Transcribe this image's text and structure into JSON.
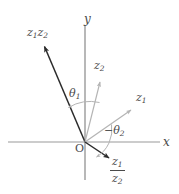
{
  "figure": {
    "background_color": "#ffffff",
    "width": 179,
    "height": 194
  },
  "colors": {
    "axis": "#9a9a9a",
    "vector_dark": "#2b2b2b",
    "vector_light": "#b4b4b4",
    "arc": "#b4b4b4",
    "text": "#4a4a4a"
  },
  "axes": {
    "origin_label": "O",
    "x_label": "x",
    "y_label": "y",
    "x_axis": {
      "x1": 8,
      "y1": 142,
      "x2": 160,
      "y2": 142
    },
    "y_axis": {
      "x1": 85,
      "y1": 25,
      "x2": 85,
      "y2": 180
    }
  },
  "vectors": [
    {
      "name": "z1z2",
      "label_parts": [
        "z",
        "1",
        "z",
        "2"
      ],
      "label_text": "z₁z₂",
      "style": "dark",
      "from": {
        "x": 85,
        "y": 142
      },
      "to": {
        "x": 42,
        "y": 41
      }
    },
    {
      "name": "z2",
      "label_text": "z₂",
      "style": "light",
      "from": {
        "x": 85,
        "y": 142
      },
      "to": {
        "x": 101,
        "y": 78
      }
    },
    {
      "name": "z1",
      "label_text": "z₁",
      "style": "light",
      "from": {
        "x": 85,
        "y": 142
      },
      "to": {
        "x": 134,
        "y": 107
      }
    },
    {
      "name": "z1-over-z2",
      "label_numerator": "z₁",
      "label_denominator": "z₂",
      "style": "dark",
      "from": {
        "x": 85,
        "y": 142
      },
      "to": {
        "x": 113,
        "y": 161
      }
    }
  ],
  "angles": [
    {
      "name": "theta1",
      "label_text": "θ₁",
      "description": "arc from z2 direction rotating counter-clockwise to z1z2 direction"
    },
    {
      "name": "minus-theta2",
      "label_text": "−θ₂",
      "description": "arc from positive x-axis / z1 direction rotating clockwise to z1/z2 direction"
    }
  ],
  "labels": {
    "y": "y",
    "x": "x",
    "origin": "O",
    "z1z2_first": "z",
    "z1z2_sub1": "1",
    "z1z2_second": "z",
    "z1z2_sub2": "2",
    "z2_base": "z",
    "z2_sub": "2",
    "z1_base": "z",
    "z1_sub": "1",
    "theta1_base": "θ",
    "theta1_sub": "1",
    "theta2_sign": "−",
    "theta2_base": "θ",
    "theta2_sub": "2",
    "frac_num_base": "z",
    "frac_num_sub": "1",
    "frac_den_base": "z",
    "frac_den_sub": "2"
  }
}
